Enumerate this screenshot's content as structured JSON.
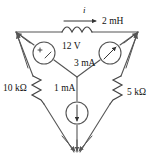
{
  "figure": {
    "background_color": "#ffffff",
    "line_color": "#555555",
    "text_color": "#111111",
    "width": 154,
    "height": 161
  },
  "labels": {
    "current_i": "i",
    "inductor": "2 mH",
    "voltage_source": "12 V",
    "current_source_right": "3 mA",
    "current_source_bottom": "1 mA",
    "resistor_left": "10 kΩ",
    "resistor_right": "5 kΩ"
  },
  "components": [
    {
      "name": "inductor",
      "symbol": "coil",
      "value": "2 mH",
      "branch": "top",
      "annotation": "i"
    },
    {
      "name": "voltage-source",
      "symbol": "circle-plus-minus",
      "value": "12 V",
      "branch": "upper-left-spoke"
    },
    {
      "name": "current-source-right",
      "symbol": "circle-arrow-diagonal",
      "value": "3 mA",
      "branch": "upper-right-spoke",
      "arrow_direction": "up-right"
    },
    {
      "name": "current-source-bottom",
      "symbol": "circle-arrow-down",
      "value": "1 mA",
      "branch": "bottom-spoke",
      "arrow_direction": "down"
    },
    {
      "name": "resistor-left",
      "symbol": "zigzag",
      "value": "10 kΩ",
      "branch": "left-diagonal"
    },
    {
      "name": "resistor-right",
      "symbol": "zigzag",
      "value": "5 kΩ",
      "branch": "right-diagonal"
    }
  ],
  "nodes": {
    "top_left": "top-left vertex",
    "top_right": "top-right vertex",
    "bottom": "bottom vertex",
    "center": "center node"
  }
}
